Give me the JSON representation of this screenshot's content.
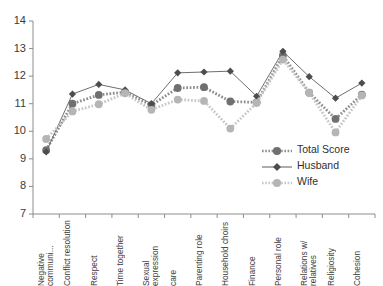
{
  "chart_data": {
    "type": "line",
    "title": "",
    "xlabel": "",
    "ylabel": "",
    "ylim": [
      7,
      14
    ],
    "yticks": [
      7,
      8,
      9,
      10,
      11,
      12,
      13,
      14
    ],
    "grid": false,
    "legend_position": "inside-right",
    "categories": [
      "Negative communi...",
      "Conflict resolution",
      "Respect",
      "Time together",
      "Sexual expression",
      "care",
      "Parenting role",
      "Household choirs",
      "Finance",
      "Personal role",
      "Relations w/ relatives",
      "Religiosity",
      "Cohesion"
    ],
    "series": [
      {
        "name": "Total Score",
        "color": "#707070",
        "marker": "circle",
        "linestyle": "dotted",
        "values": [
          9.32,
          11.0,
          11.32,
          11.42,
          10.95,
          11.57,
          11.6,
          11.08,
          11.05,
          12.75,
          11.4,
          10.45,
          11.33
        ]
      },
      {
        "name": "Husband",
        "color": "#4d4d4d",
        "marker": "diamond",
        "linestyle": "solid",
        "values": [
          9.25,
          11.35,
          11.7,
          11.5,
          11.0,
          12.12,
          12.15,
          12.18,
          11.27,
          12.9,
          11.98,
          11.2,
          11.75
        ]
      },
      {
        "name": "Wife",
        "color": "#b5b5b5",
        "marker": "circle",
        "linestyle": "dotted",
        "values": [
          9.72,
          10.72,
          10.98,
          11.38,
          10.78,
          11.15,
          11.1,
          10.1,
          11.03,
          12.6,
          11.4,
          9.96,
          11.3
        ]
      }
    ]
  },
  "axis": {
    "y_tick_labels": [
      "14",
      "13",
      "12",
      "11",
      "10",
      "9",
      "8",
      "7"
    ]
  },
  "legend": {
    "items": [
      {
        "label": "Total Score"
      },
      {
        "label": "Husband"
      },
      {
        "label": "Wife"
      }
    ]
  },
  "colors": {
    "total_score": "#707070",
    "husband": "#4d4d4d",
    "wife": "#b5b5b5",
    "axis": "#8c8c8c",
    "text": "#3b3b3b"
  }
}
